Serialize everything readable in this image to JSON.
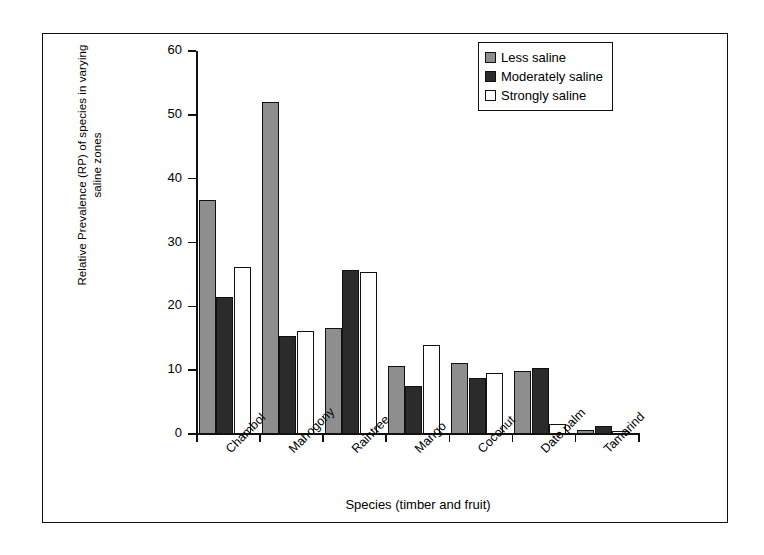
{
  "chart_data": {
    "type": "bar",
    "title": "",
    "xlabel": "Species (timber and fruit)",
    "ylabel": "Relative Prevalence (RP) of species in varying saline zones",
    "ylabel_line1": "Relative Prevalence (RP) of species in varying",
    "ylabel_line2": "saline zones",
    "categories": [
      "Chambol",
      "Mahogony",
      "Raintree",
      "Mango",
      "Coconut",
      "Date palm",
      "Tamarind"
    ],
    "series": [
      {
        "name": "Less saline",
        "color": "#8e8e8e",
        "values": [
          36.6,
          52.0,
          16.6,
          10.6,
          11.1,
          9.9,
          0.7
        ]
      },
      {
        "name": "Moderately saline",
        "color": "#2b2b2b",
        "values": [
          21.5,
          15.3,
          25.7,
          7.5,
          8.8,
          10.4,
          1.3
        ]
      },
      {
        "name": "Strongly saline",
        "color": "#ffffff",
        "values": [
          26.2,
          16.2,
          25.4,
          14.0,
          9.6,
          1.5,
          0.5
        ]
      }
    ],
    "ylim": [
      0,
      60
    ],
    "yticks": [
      0,
      10,
      20,
      30,
      40,
      50,
      60
    ],
    "grid": false,
    "legend_position": "top-right"
  },
  "legend": {
    "items": [
      {
        "label": "Less saline"
      },
      {
        "label": "Moderately saline"
      },
      {
        "label": "Strongly saline"
      }
    ]
  }
}
